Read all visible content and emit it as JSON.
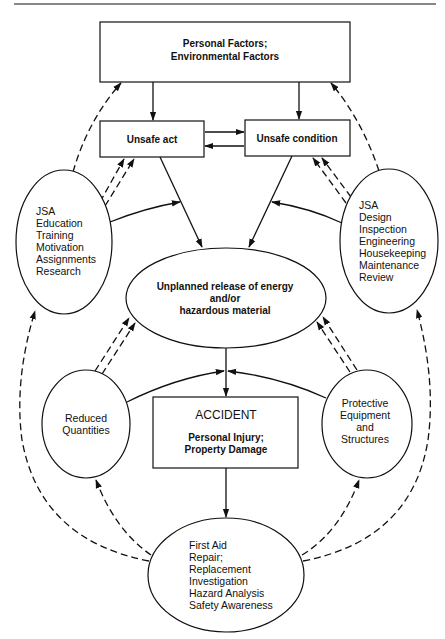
{
  "diagram": {
    "nodes": {
      "factors": {
        "lines": [
          "Personal Factors;",
          "Environmental Factors"
        ]
      },
      "unsafe_act": {
        "label": "Unsafe act"
      },
      "unsafe_condition": {
        "label": "Unsafe condition"
      },
      "left_controls": {
        "lines": [
          "JSA",
          "Education",
          "Training",
          "Motivation",
          "Assignments",
          "Research"
        ]
      },
      "right_controls": {
        "lines": [
          "JSA",
          "Design",
          "Inspection",
          "Engineering",
          "Housekeeping",
          "Maintenance",
          "Review"
        ]
      },
      "release": {
        "lines": [
          "Unplanned release of energy",
          "and/or",
          "hazardous material"
        ]
      },
      "reduced": {
        "lines": [
          "Reduced",
          "Quantities"
        ]
      },
      "protective": {
        "lines": [
          "Protective",
          "Equipment",
          "and",
          "Structures"
        ]
      },
      "accident": {
        "title": "ACCIDENT",
        "lines": [
          "Personal Injury;",
          "Property Damage"
        ]
      },
      "response": {
        "lines": [
          "First Aid",
          "Repair;",
          "Replacement",
          "Investigation",
          "Hazard Analysis",
          "Safety Awareness"
        ]
      }
    },
    "edges": [
      {
        "from": "factors",
        "to": "unsafe_act",
        "style": "solid"
      },
      {
        "from": "factors",
        "to": "unsafe_condition",
        "style": "solid"
      },
      {
        "from": "unsafe_act",
        "to": "unsafe_condition",
        "style": "solid"
      },
      {
        "from": "unsafe_condition",
        "to": "unsafe_act",
        "style": "solid"
      },
      {
        "from": "unsafe_act",
        "to": "release",
        "style": "solid"
      },
      {
        "from": "unsafe_condition",
        "to": "release",
        "style": "solid"
      },
      {
        "from": "left_controls",
        "to": "unsafe_act_release_link",
        "style": "solid"
      },
      {
        "from": "right_controls",
        "to": "unsafe_condition_release_link",
        "style": "solid"
      },
      {
        "from": "left_controls",
        "to": "unsafe_act",
        "style": "double-dashed"
      },
      {
        "from": "right_controls",
        "to": "unsafe_condition",
        "style": "double-dashed"
      },
      {
        "from": "left_controls",
        "to": "factors",
        "style": "dashed"
      },
      {
        "from": "right_controls",
        "to": "factors",
        "style": "dashed"
      },
      {
        "from": "release",
        "to": "accident",
        "style": "solid"
      },
      {
        "from": "reduced",
        "to": "release_accident_link",
        "style": "solid"
      },
      {
        "from": "protective",
        "to": "release_accident_link",
        "style": "solid"
      },
      {
        "from": "reduced",
        "to": "release",
        "style": "double-dashed"
      },
      {
        "from": "protective",
        "to": "release",
        "style": "double-dashed"
      },
      {
        "from": "accident",
        "to": "response",
        "style": "solid"
      },
      {
        "from": "response",
        "to": "reduced",
        "style": "dashed"
      },
      {
        "from": "response",
        "to": "protective",
        "style": "dashed"
      },
      {
        "from": "response",
        "to": "left_controls",
        "style": "dashed"
      },
      {
        "from": "response",
        "to": "right_controls",
        "style": "dashed"
      }
    ]
  }
}
